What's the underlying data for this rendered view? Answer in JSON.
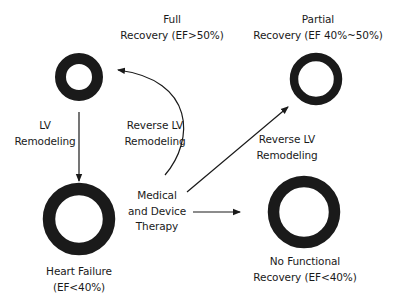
{
  "diagram": {
    "nodes": {
      "normal": {
        "shape": "ring",
        "size": "small"
      },
      "heart_failure": {
        "shape": "ring",
        "size": "large",
        "lines": [
          "Heart Failure",
          "(EF<40%)"
        ]
      },
      "full_recovery": {
        "lines": [
          "Full",
          "Recovery (EF>50%)"
        ]
      },
      "partial_recovery": {
        "shape": "ring",
        "size": "medium",
        "lines": [
          "Partial",
          "Recovery (EF 40%~50%)"
        ]
      },
      "no_recovery": {
        "shape": "ring",
        "size": "large",
        "lines": [
          "No Functional",
          "Recovery (EF<40%)"
        ]
      },
      "therapy": {
        "lines": [
          "Medical",
          "and Device",
          "Therapy"
        ]
      }
    },
    "edges": {
      "lv_remodeling": {
        "from": "normal",
        "to": "heart_failure",
        "lines": [
          "LV",
          "Remodeling"
        ]
      },
      "reverse_full": {
        "from": "therapy",
        "to": "normal",
        "lines": [
          "Reverse LV",
          "Remodeling"
        ]
      },
      "reverse_partial": {
        "from": "therapy",
        "to": "partial_recovery",
        "lines": [
          "Reverse LV",
          "Remodeling"
        ]
      },
      "no_change": {
        "from": "therapy",
        "to": "no_recovery"
      }
    },
    "colors": {
      "stroke": "#1a1a1a",
      "background": "#ffffff"
    }
  }
}
